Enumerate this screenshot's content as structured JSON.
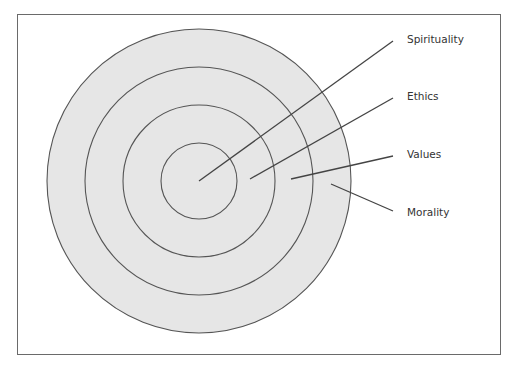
{
  "diagram": {
    "type": "concentric-circles",
    "center": [
      199,
      181
    ],
    "fill_color": "#e6e6e6",
    "stroke_color": "#555555",
    "rings": [
      {
        "name": "Morality",
        "radius": 152
      },
      {
        "name": "Values",
        "radius": 114
      },
      {
        "name": "Ethics",
        "radius": 76
      },
      {
        "name": "Spirituality",
        "radius": 38
      }
    ],
    "labels": [
      {
        "text": "Spirituality",
        "x": 407,
        "y": 33,
        "line": [
          199,
          181,
          393,
          41
        ]
      },
      {
        "text": "Ethics",
        "x": 407,
        "y": 90,
        "line": [
          250,
          179,
          393,
          98
        ]
      },
      {
        "text": "Values",
        "x": 407,
        "y": 148,
        "line": [
          291,
          179,
          393,
          156
        ]
      },
      {
        "text": "Morality",
        "x": 407,
        "y": 206,
        "line": [
          331,
          184,
          393,
          211
        ]
      }
    ]
  }
}
